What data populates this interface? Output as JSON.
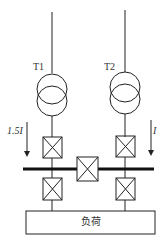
{
  "diagram": {
    "transformers": [
      {
        "label": "T1"
      },
      {
        "label": "T2"
      }
    ],
    "currents": [
      {
        "label": "1.5I",
        "side": "left"
      },
      {
        "label": "I",
        "side": "right"
      }
    ],
    "load_label": "负荷",
    "colors": {
      "line": "#222222",
      "bus": "#111111"
    }
  }
}
